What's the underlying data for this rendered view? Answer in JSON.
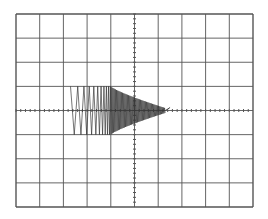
{
  "chart_data": {
    "type": "line",
    "title": "",
    "xlabel": "",
    "ylabel": "",
    "grid": {
      "on": true,
      "x_divisions": 10,
      "y_divisions": 8,
      "minor_ticks_on_center_axes": true
    },
    "xlim": [
      0,
      10
    ],
    "ylim": [
      -4,
      4
    ],
    "trace": {
      "start_x_div": 2.3,
      "dense_start_x_div": 4.0,
      "end_x_div": 6.3,
      "tail_x_div": 6.5,
      "initial_amplitude_div": 1.0,
      "final_amplitude_div": 0.1,
      "center_y_div": 0
    },
    "colors": {
      "grid": "#555555",
      "trace": "#333333",
      "background": "#ffffff"
    }
  }
}
